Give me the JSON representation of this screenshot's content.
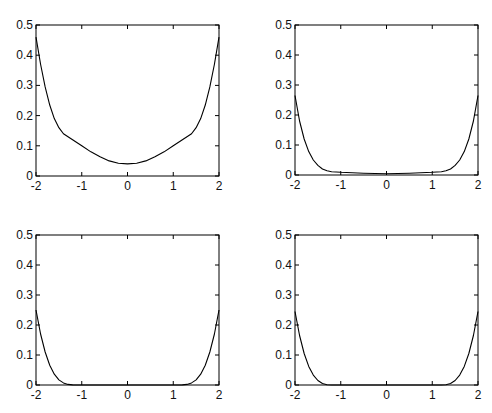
{
  "chart_data": [
    {
      "type": "line",
      "panel": "top-left",
      "title": "",
      "xlabel": "",
      "ylabel": "",
      "xlim": [
        -2,
        2
      ],
      "ylim": [
        0,
        0.5
      ],
      "xticks": [
        "-2",
        "-1",
        "0",
        "1",
        "2"
      ],
      "yticks": [
        "0",
        "0.1",
        "0.2",
        "0.3",
        "0.4",
        "0.5"
      ],
      "grid": false,
      "x": [
        -2,
        -1.9,
        -1.8,
        -1.7,
        -1.6,
        -1.5,
        -1.4,
        -1.2,
        -1.0,
        -0.8,
        -0.6,
        -0.4,
        -0.2,
        0,
        0.2,
        0.4,
        0.6,
        0.8,
        1.0,
        1.2,
        1.4,
        1.5,
        1.6,
        1.7,
        1.8,
        1.9,
        2
      ],
      "y": [
        0.46,
        0.37,
        0.295,
        0.235,
        0.19,
        0.16,
        0.14,
        0.12,
        0.1,
        0.08,
        0.064,
        0.05,
        0.042,
        0.04,
        0.042,
        0.05,
        0.064,
        0.08,
        0.1,
        0.12,
        0.14,
        0.16,
        0.19,
        0.235,
        0.295,
        0.37,
        0.46
      ]
    },
    {
      "type": "line",
      "panel": "top-right",
      "title": "",
      "xlabel": "",
      "ylabel": "",
      "xlim": [
        -2,
        2
      ],
      "ylim": [
        0,
        0.5
      ],
      "xticks": [
        "-2",
        "-1",
        "0",
        "1",
        "2"
      ],
      "yticks": [
        "0",
        "0.1",
        "0.2",
        "0.3",
        "0.4",
        "0.5"
      ],
      "grid": false,
      "x": [
        -2,
        -1.9,
        -1.8,
        -1.7,
        -1.6,
        -1.5,
        -1.4,
        -1.3,
        -1.2,
        -1.0,
        -0.5,
        0,
        0.5,
        1.0,
        1.2,
        1.3,
        1.4,
        1.5,
        1.6,
        1.7,
        1.8,
        1.9,
        2
      ],
      "y": [
        0.265,
        0.18,
        0.12,
        0.078,
        0.05,
        0.032,
        0.02,
        0.014,
        0.011,
        0.009,
        0.006,
        0.004,
        0.006,
        0.009,
        0.011,
        0.014,
        0.02,
        0.032,
        0.05,
        0.078,
        0.12,
        0.18,
        0.265
      ]
    },
    {
      "type": "line",
      "panel": "bottom-left",
      "title": "",
      "xlabel": "",
      "ylabel": "",
      "xlim": [
        -2,
        2
      ],
      "ylim": [
        0,
        0.5
      ],
      "xticks": [
        "-2",
        "-1",
        "0",
        "1",
        "2"
      ],
      "yticks": [
        "0",
        "0.1",
        "0.2",
        "0.3",
        "0.4",
        "0.5"
      ],
      "grid": false,
      "x": [
        -2,
        -1.9,
        -1.8,
        -1.7,
        -1.6,
        -1.5,
        -1.4,
        -1.3,
        -1.2,
        -1.1,
        -1.0,
        0,
        1.0,
        1.1,
        1.2,
        1.3,
        1.4,
        1.5,
        1.6,
        1.7,
        1.8,
        1.9,
        2
      ],
      "y": [
        0.25,
        0.17,
        0.11,
        0.066,
        0.036,
        0.017,
        0.007,
        0.002,
        0.0005,
        0,
        0,
        0,
        0,
        0,
        0.0005,
        0.002,
        0.007,
        0.017,
        0.036,
        0.066,
        0.11,
        0.17,
        0.25
      ]
    },
    {
      "type": "line",
      "panel": "bottom-right",
      "title": "",
      "xlabel": "",
      "ylabel": "",
      "xlim": [
        -2,
        2
      ],
      "ylim": [
        0,
        0.5
      ],
      "xticks": [
        "-2",
        "-1",
        "0",
        "1",
        "2"
      ],
      "yticks": [
        "0",
        "0.1",
        "0.2",
        "0.3",
        "0.4",
        "0.5"
      ],
      "grid": false,
      "x": [
        -2,
        -1.9,
        -1.8,
        -1.7,
        -1.6,
        -1.5,
        -1.4,
        -1.3,
        -1.2,
        -1.1,
        -1.0,
        0,
        1.0,
        1.1,
        1.2,
        1.3,
        1.4,
        1.5,
        1.6,
        1.7,
        1.8,
        1.9,
        2
      ],
      "y": [
        0.245,
        0.165,
        0.105,
        0.062,
        0.033,
        0.015,
        0.005,
        0.001,
        0,
        0,
        0,
        0,
        0,
        0,
        0,
        0.001,
        0.005,
        0.015,
        0.033,
        0.062,
        0.105,
        0.165,
        0.245
      ]
    }
  ],
  "style": {
    "line_color": "#000000",
    "axis_color": "#000000",
    "background": "#ffffff"
  },
  "layout": {
    "panels": [
      {
        "left": 36,
        "top": 25,
        "width": 183,
        "height": 151
      },
      {
        "left": 295,
        "top": 25,
        "width": 183,
        "height": 150
      },
      {
        "left": 36,
        "top": 235,
        "width": 183,
        "height": 150
      },
      {
        "left": 295,
        "top": 235,
        "width": 183,
        "height": 150
      }
    ]
  }
}
